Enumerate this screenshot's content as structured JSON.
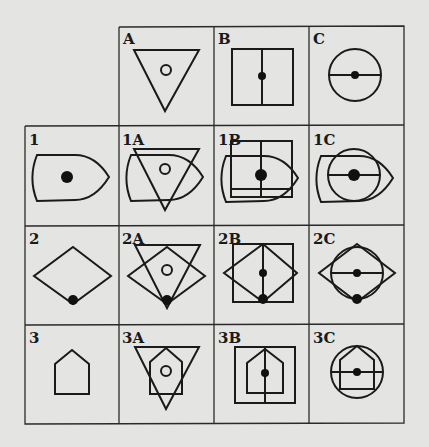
{
  "diagram": {
    "column_headers": [
      {
        "label": "A",
        "shape": "inverted-triangle-with-small-circle"
      },
      {
        "label": "B",
        "shape": "square-with-vertical-line-and-dot"
      },
      {
        "label": "C",
        "shape": "circle-with-horizontal-line-and-dot"
      }
    ],
    "row_headers": [
      {
        "label": "1",
        "shape": "bullet-shape-with-dot"
      },
      {
        "label": "2",
        "shape": "diamond-with-dot-at-bottom"
      },
      {
        "label": "3",
        "shape": "house-pentagon"
      }
    ],
    "cells": {
      "1A": "1A",
      "1B": "1B",
      "1C": "1C",
      "2A": "2A",
      "2B": "2B",
      "2C": "2C",
      "3A": "3A",
      "3B": "3B",
      "3C": "3C"
    },
    "colors": {
      "ink": "#1a1a1a",
      "paper": "#e4e4e2"
    }
  }
}
